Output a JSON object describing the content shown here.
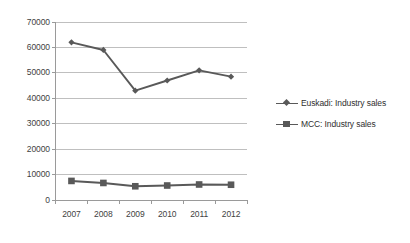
{
  "chart_data": {
    "type": "line",
    "title": "",
    "subtitle": "",
    "xlabel": "",
    "ylabel": "",
    "categories": [
      "2007",
      "2008",
      "2009",
      "2010",
      "2011",
      "2012"
    ],
    "series": [
      {
        "name": "Euskadi: Industry sales",
        "marker": "diamond",
        "color": "#595959",
        "values": [
          62000,
          59000,
          43000,
          47000,
          51000,
          48500
        ]
      },
      {
        "name": "MCC: Industry sales",
        "marker": "square",
        "color": "#595959",
        "values": [
          7500,
          6700,
          5400,
          5700,
          6100,
          6000
        ]
      }
    ],
    "ylim": [
      0,
      70000
    ],
    "yticks": [
      0,
      10000,
      20000,
      30000,
      40000,
      50000,
      60000,
      70000
    ],
    "ytick_labels": [
      "0",
      "10000",
      "20000",
      "30000",
      "40000",
      "50000",
      "60000",
      "70000"
    ],
    "grid": true,
    "grid_axis": "y",
    "legend_position": "right",
    "colors": {
      "background": "#ffffff",
      "gridline": "#bfbfbf",
      "axis": "#9a9a9a",
      "series": "#595959",
      "text": "#3f3f3f"
    }
  }
}
